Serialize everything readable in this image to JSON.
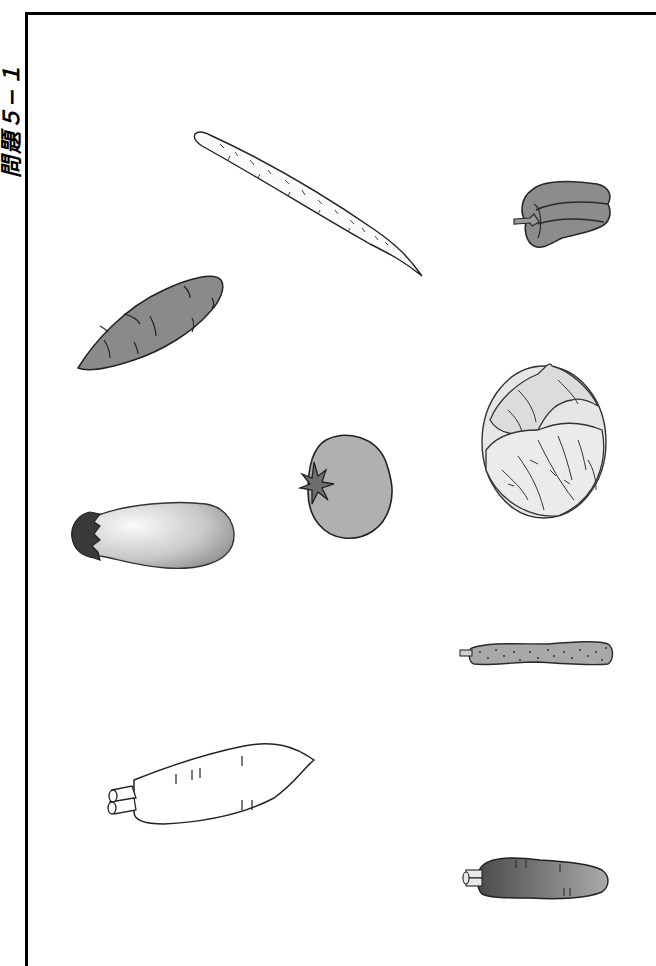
{
  "worksheet": {
    "title": "問題５−１",
    "vegetables": [
      {
        "id": "burdock",
        "name": "ごぼう (burdock root)"
      },
      {
        "id": "bell-pepper",
        "name": "ピーマン (bell pepper)"
      },
      {
        "id": "sweet-potato",
        "name": "さつまいも (sweet potato)"
      },
      {
        "id": "cabbage",
        "name": "キャベツ (cabbage)"
      },
      {
        "id": "tomato",
        "name": "トマト (tomato)"
      },
      {
        "id": "eggplant",
        "name": "なす (eggplant)"
      },
      {
        "id": "cucumber",
        "name": "きゅうり (cucumber)"
      },
      {
        "id": "daikon",
        "name": "だいこん (daikon radish)"
      },
      {
        "id": "carrot",
        "name": "にんじん (carrot)"
      }
    ]
  },
  "colors": {
    "frame": "#000000",
    "outline": "#222222",
    "mid_gray": "#8a8a8a",
    "light_gray": "#b5b5b5",
    "dark": "#3a3a3a"
  }
}
